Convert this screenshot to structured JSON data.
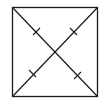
{
  "diagram": {
    "type": "geometry",
    "shape": "square",
    "stroke_color": "#1a1a1a",
    "background": "#ffffff",
    "square": {
      "x": 12,
      "y": 7,
      "width": 85,
      "height": 89
    },
    "diagonals": [
      {
        "from": [
          12,
          7
        ],
        "to": [
          97,
          96
        ]
      },
      {
        "from": [
          97,
          7
        ],
        "to": [
          12,
          96
        ]
      }
    ],
    "tick_marks": [
      {
        "at": [
          36,
          32
        ],
        "segment": "top-left half"
      },
      {
        "at": [
          73,
          32
        ],
        "segment": "top-right half"
      },
      {
        "at": [
          33,
          73
        ],
        "segment": "bottom-left half"
      },
      {
        "at": [
          77,
          75
        ],
        "segment": "bottom-right half"
      }
    ]
  }
}
